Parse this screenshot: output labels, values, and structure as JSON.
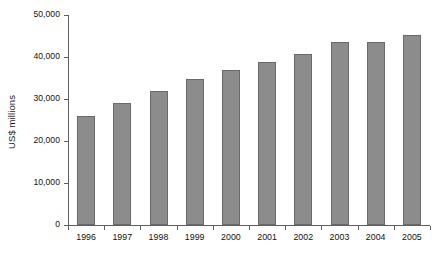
{
  "chart_data": {
    "type": "bar",
    "title": "",
    "subtitle": "",
    "xlabel": "",
    "ylabel": "US$ millions",
    "categories": [
      "1996",
      "1997",
      "1998",
      "1999",
      "2000",
      "2001",
      "2002",
      "2003",
      "2004",
      "2005"
    ],
    "values": [
      26000,
      29000,
      32000,
      34700,
      37000,
      38800,
      40600,
      43500,
      43500,
      45200
    ],
    "series": [
      {
        "name": "US$ millions",
        "values": [
          26000,
          29000,
          32000,
          34700,
          37000,
          38800,
          40600,
          43500,
          43500,
          45200
        ]
      }
    ],
    "ylim": [
      0,
      50000
    ],
    "yticks": [
      0,
      10000,
      20000,
      30000,
      40000,
      50000
    ],
    "ytick_labels": [
      "0",
      "10,000",
      "20,000",
      "30,000",
      "40,000",
      "50,000"
    ],
    "grid": false,
    "legend": false,
    "legend_position": "none",
    "bar_color": "#8c8c8c",
    "bar_edge_color": "#6a6a6a",
    "axis_color": "#5f5f5f",
    "text_color": "#131313",
    "background_color": "#ffffff"
  }
}
